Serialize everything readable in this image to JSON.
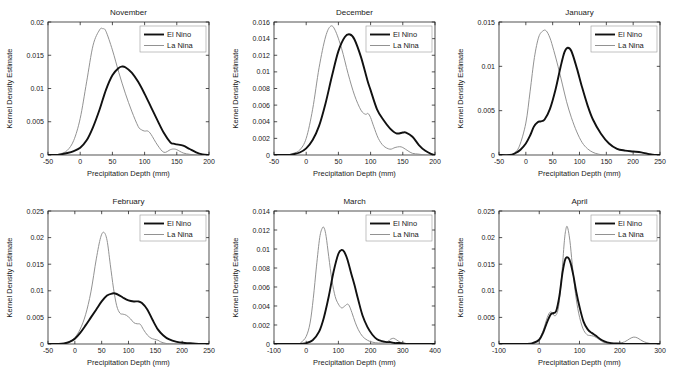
{
  "figure": {
    "legend": {
      "elnino_label": "El Nino",
      "lanina_label": "La Nina",
      "elnino_color": "#111111",
      "lanina_color": "#8c8c8c"
    },
    "common": {
      "xlabel": "Precipitation Depth (mm)",
      "ylabel": "Kernel Density Estimate"
    }
  },
  "chart_data": [
    {
      "type": "line",
      "title": "November",
      "xlabel": "Precipitation Depth (mm)",
      "ylabel": "Kernel Density Estimate",
      "xlim": [
        -50,
        200
      ],
      "ylim": [
        0,
        0.02
      ],
      "xticks": [
        -50,
        0,
        50,
        100,
        150,
        200
      ],
      "yticks": [
        0,
        0.005,
        0.01,
        0.015,
        0.02
      ],
      "ytick_labels": [
        "0",
        "0.005",
        "0.01",
        "0.015",
        "0.02"
      ],
      "grid": false,
      "legend_position": "top-right",
      "series": [
        {
          "name": "El Nino",
          "x": [
            -50,
            -40,
            -30,
            -20,
            -10,
            0,
            10,
            20,
            30,
            40,
            50,
            60,
            65,
            70,
            80,
            90,
            100,
            110,
            120,
            130,
            140,
            145,
            150,
            160,
            170,
            180,
            190,
            200
          ],
          "y": [
            0,
            0,
            0.0001,
            0.0003,
            0.0006,
            0.0011,
            0.0022,
            0.0042,
            0.0068,
            0.0098,
            0.012,
            0.0131,
            0.0133,
            0.0132,
            0.0124,
            0.011,
            0.0092,
            0.0072,
            0.0052,
            0.0033,
            0.0019,
            0.0017,
            0.0016,
            0.0014,
            0.0009,
            0.0004,
            0.0001,
            0
          ]
        },
        {
          "name": "La Nina",
          "x": [
            -50,
            -40,
            -30,
            -20,
            -10,
            0,
            10,
            20,
            30,
            35,
            40,
            50,
            60,
            70,
            80,
            90,
            95,
            100,
            105,
            110,
            120,
            130,
            140,
            145,
            150,
            160,
            170,
            180,
            190,
            200
          ],
          "y": [
            0,
            0,
            0.0002,
            0.0007,
            0.0022,
            0.0055,
            0.011,
            0.0165,
            0.0188,
            0.019,
            0.0186,
            0.0158,
            0.0124,
            0.0093,
            0.0066,
            0.0043,
            0.0038,
            0.0036,
            0.0036,
            0.0031,
            0.0015,
            0.0004,
            0.0008,
            0.0009,
            0.0008,
            0.0003,
            0.0001,
            0,
            0,
            0
          ]
        }
      ]
    },
    {
      "type": "line",
      "title": "December",
      "xlabel": "Precipitation Depth (mm)",
      "ylabel": "Kernel Density Estimate",
      "xlim": [
        -50,
        200
      ],
      "ylim": [
        0,
        0.016
      ],
      "xticks": [
        -50,
        0,
        50,
        100,
        150,
        200
      ],
      "yticks": [
        0,
        0.002,
        0.004,
        0.006,
        0.008,
        0.01,
        0.012,
        0.014,
        0.016
      ],
      "ytick_labels": [
        "0",
        "0.002",
        "0.004",
        "0.006",
        "0.008",
        "0.01",
        "0.012",
        "0.014",
        "0.016"
      ],
      "grid": false,
      "legend_position": "top-right",
      "series": [
        {
          "name": "El Nino",
          "x": [
            -50,
            -30,
            -20,
            -10,
            0,
            10,
            20,
            30,
            40,
            50,
            60,
            68,
            75,
            85,
            95,
            100,
            110,
            120,
            130,
            140,
            150,
            155,
            165,
            175,
            185,
            195,
            200
          ],
          "y": [
            0,
            0,
            0.0001,
            0.0003,
            0.0008,
            0.0018,
            0.0035,
            0.0062,
            0.0095,
            0.0125,
            0.0142,
            0.0145,
            0.0139,
            0.0118,
            0.009,
            0.0078,
            0.0055,
            0.0042,
            0.0032,
            0.0026,
            0.0027,
            0.0027,
            0.0022,
            0.0012,
            0.0005,
            0.0001,
            0
          ]
        },
        {
          "name": "La Nina",
          "x": [
            -50,
            -30,
            -20,
            -10,
            0,
            10,
            20,
            30,
            38,
            45,
            55,
            65,
            75,
            85,
            92,
            96,
            100,
            105,
            112,
            120,
            130,
            138,
            145,
            150,
            158,
            165,
            175,
            185,
            195,
            200
          ],
          "y": [
            0,
            0,
            0.0002,
            0.0006,
            0.002,
            0.0055,
            0.0105,
            0.0142,
            0.0155,
            0.015,
            0.0128,
            0.0098,
            0.0072,
            0.0054,
            0.0049,
            0.005,
            0.0045,
            0.0034,
            0.002,
            0.0011,
            0.0007,
            0.0009,
            0.001,
            0.0009,
            0.0005,
            0.0002,
            0.0001,
            0,
            0,
            0
          ]
        }
      ]
    },
    {
      "type": "line",
      "title": "January",
      "xlabel": "Precipitation Depth (mm)",
      "ylabel": "Kernel Density Estimate",
      "xlim": [
        -50,
        250
      ],
      "ylim": [
        0,
        0.015
      ],
      "xticks": [
        -50,
        0,
        50,
        100,
        150,
        200,
        250
      ],
      "yticks": [
        0,
        0.005,
        0.01,
        0.015
      ],
      "ytick_labels": [
        "0",
        "0.005",
        "0.01",
        "0.015"
      ],
      "grid": false,
      "legend_position": "top-right",
      "series": [
        {
          "name": "El Nino",
          "x": [
            -50,
            -30,
            -20,
            -10,
            0,
            8,
            15,
            22,
            28,
            35,
            45,
            55,
            65,
            72,
            78,
            85,
            95,
            105,
            115,
            125,
            140,
            155,
            170,
            185,
            200,
            215,
            230,
            240,
            250
          ],
          "y": [
            0,
            0,
            0.0002,
            0.0006,
            0.0013,
            0.0022,
            0.0032,
            0.0037,
            0.0038,
            0.004,
            0.0052,
            0.0073,
            0.01,
            0.0116,
            0.0121,
            0.0117,
            0.0098,
            0.0076,
            0.0056,
            0.004,
            0.0024,
            0.0013,
            0.0007,
            0.0005,
            0.0004,
            0.0003,
            0.0001,
            0.0,
            0
          ]
        },
        {
          "name": "La Nina",
          "x": [
            -50,
            -30,
            -22,
            -12,
            0,
            8,
            16,
            24,
            32,
            38,
            45,
            52,
            60,
            68,
            76,
            85,
            95,
            105,
            115,
            125,
            135,
            145,
            155,
            170,
            185,
            200,
            225,
            250
          ],
          "y": [
            0,
            0,
            0.0002,
            0.001,
            0.0036,
            0.0072,
            0.011,
            0.0133,
            0.014,
            0.014,
            0.0132,
            0.0118,
            0.01,
            0.008,
            0.006,
            0.0042,
            0.0026,
            0.0014,
            0.0007,
            0.0003,
            0.0001,
            0.0,
            0,
            0,
            0,
            0,
            0,
            0
          ]
        }
      ]
    },
    {
      "type": "line",
      "title": "February",
      "xlabel": "Precipitation Depth (mm)",
      "ylabel": "Kernel Density Estimate",
      "xlim": [
        -50,
        250
      ],
      "ylim": [
        0,
        0.025
      ],
      "xticks": [
        -50,
        0,
        50,
        100,
        150,
        200,
        250
      ],
      "yticks": [
        0,
        0.005,
        0.01,
        0.015,
        0.02,
        0.025
      ],
      "ytick_labels": [
        "0",
        "0.005",
        "0.01",
        "0.015",
        "0.02",
        "0.025"
      ],
      "grid": false,
      "legend_position": "top-right",
      "series": [
        {
          "name": "El Nino",
          "x": [
            -50,
            -30,
            -20,
            -10,
            0,
            10,
            20,
            30,
            40,
            50,
            60,
            70,
            75,
            82,
            90,
            100,
            110,
            118,
            125,
            135,
            145,
            155,
            165,
            175,
            190,
            205,
            220,
            235,
            250
          ],
          "y": [
            0,
            0,
            0.0001,
            0.0004,
            0.001,
            0.0021,
            0.0035,
            0.005,
            0.0065,
            0.008,
            0.0091,
            0.0095,
            0.0095,
            0.0092,
            0.0087,
            0.0082,
            0.008,
            0.008,
            0.0077,
            0.0065,
            0.0045,
            0.0027,
            0.0016,
            0.0009,
            0.0004,
            0.0002,
            0.0001,
            0,
            0
          ]
        },
        {
          "name": "La Nina",
          "x": [
            -50,
            -30,
            -20,
            -10,
            0,
            10,
            20,
            30,
            40,
            48,
            54,
            60,
            66,
            72,
            78,
            84,
            90,
            96,
            104,
            110,
            116,
            122,
            128,
            135,
            142,
            148,
            155,
            160,
            170,
            185,
            210,
            250
          ],
          "y": [
            0,
            0,
            0.0001,
            0.0004,
            0.0012,
            0.0028,
            0.0055,
            0.0098,
            0.016,
            0.02,
            0.021,
            0.0195,
            0.015,
            0.0105,
            0.0072,
            0.0058,
            0.0056,
            0.0054,
            0.0047,
            0.004,
            0.0038,
            0.0037,
            0.0027,
            0.0017,
            0.0011,
            0.0009,
            0.0007,
            0.0004,
            0.0001,
            0.0,
            0,
            0
          ]
        }
      ]
    },
    {
      "type": "line",
      "title": "March",
      "xlabel": "Precipitation Depth (mm)",
      "ylabel": "Kernel Density Estimate",
      "xlim": [
        -100,
        400
      ],
      "ylim": [
        0,
        0.014
      ],
      "xticks": [
        -100,
        0,
        100,
        200,
        300,
        400
      ],
      "yticks": [
        0,
        0.002,
        0.004,
        0.006,
        0.008,
        0.01,
        0.012,
        0.014
      ],
      "ytick_labels": [
        "0",
        "0.002",
        "0.004",
        "0.006",
        "0.008",
        "0.01",
        "0.012",
        "0.014"
      ],
      "grid": false,
      "legend_position": "top-right",
      "series": [
        {
          "name": "El Nino",
          "x": [
            -100,
            -20,
            0,
            20,
            40,
            55,
            70,
            85,
            100,
            110,
            118,
            128,
            140,
            150,
            162,
            175,
            190,
            205,
            220,
            235,
            250,
            262,
            275,
            290,
            310,
            340,
            370,
            400
          ],
          "y": [
            0,
            0,
            0.0001,
            0.0004,
            0.0013,
            0.0028,
            0.005,
            0.0076,
            0.0095,
            0.0099,
            0.0097,
            0.0089,
            0.0074,
            0.0062,
            0.0046,
            0.003,
            0.0018,
            0.001,
            0.0005,
            0.0003,
            0.0002,
            0.0002,
            0.0001,
            0.0001,
            0,
            0,
            0,
            0
          ]
        },
        {
          "name": "La Nina",
          "x": [
            -100,
            -30,
            -15,
            0,
            12,
            22,
            32,
            42,
            50,
            56,
            62,
            70,
            80,
            90,
            100,
            110,
            120,
            128,
            134,
            142,
            152,
            162,
            175,
            190,
            205,
            225,
            250,
            262,
            272,
            282,
            300,
            340,
            400
          ],
          "y": [
            0,
            0,
            0.0002,
            0.0008,
            0.0022,
            0.0048,
            0.0082,
            0.0112,
            0.0122,
            0.0122,
            0.0113,
            0.0092,
            0.0067,
            0.005,
            0.0042,
            0.0038,
            0.004,
            0.0042,
            0.004,
            0.0033,
            0.0023,
            0.0015,
            0.0008,
            0.0004,
            0.0002,
            0.0001,
            0.0002,
            0.0005,
            0.0006,
            0.0004,
            0.0001,
            0,
            0
          ]
        }
      ]
    },
    {
      "type": "line",
      "title": "April",
      "xlabel": "Precipitation Depth (mm)",
      "ylabel": "Kernel Density Estimate",
      "xlim": [
        -100,
        300
      ],
      "ylim": [
        0,
        0.025
      ],
      "xticks": [
        -100,
        0,
        100,
        200,
        300
      ],
      "yticks": [
        0,
        0.005,
        0.01,
        0.015,
        0.02,
        0.025
      ],
      "ytick_labels": [
        "0",
        "0.005",
        "0.01",
        "0.015",
        "0.02",
        "0.025"
      ],
      "grid": false,
      "legend_position": "top-right",
      "series": [
        {
          "name": "El Nino",
          "x": [
            -100,
            -30,
            -15,
            0,
            10,
            20,
            28,
            34,
            42,
            50,
            58,
            65,
            72,
            78,
            85,
            92,
            100,
            110,
            120,
            130,
            140,
            150,
            162,
            175,
            190,
            210,
            230,
            250,
            275,
            300
          ],
          "y": [
            0,
            0,
            0.0002,
            0.0008,
            0.0022,
            0.0042,
            0.0055,
            0.0058,
            0.0062,
            0.009,
            0.0135,
            0.016,
            0.0162,
            0.0152,
            0.0128,
            0.0098,
            0.007,
            0.0042,
            0.0028,
            0.0021,
            0.0016,
            0.001,
            0.0005,
            0.0002,
            0.0001,
            0,
            0,
            0,
            0,
            0
          ]
        },
        {
          "name": "La Nina",
          "x": [
            -100,
            -30,
            -15,
            0,
            10,
            20,
            27,
            33,
            40,
            48,
            56,
            62,
            66,
            70,
            76,
            82,
            90,
            98,
            108,
            118,
            126,
            134,
            142,
            150,
            160,
            175,
            195,
            212,
            225,
            235,
            245,
            258,
            275,
            300
          ],
          "y": [
            0,
            0,
            0.0002,
            0.001,
            0.0026,
            0.005,
            0.006,
            0.0058,
            0.0053,
            0.007,
            0.013,
            0.019,
            0.0215,
            0.022,
            0.0195,
            0.015,
            0.0095,
            0.0058,
            0.003,
            0.0018,
            0.0016,
            0.0015,
            0.0012,
            0.0008,
            0.0003,
            0.0001,
            0.0001,
            0.0004,
            0.001,
            0.0013,
            0.0011,
            0.0005,
            0.0001,
            0
          ]
        }
      ]
    }
  ]
}
